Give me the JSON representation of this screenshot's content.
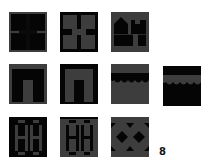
{
  "puzzle": {
    "colors": {
      "dark": "#050505",
      "gray": "#3d3d3d",
      "background": "#ffffff"
    },
    "rows": [
      {
        "tiles": [
          {
            "pattern": "cross-dark-on-gray-lines"
          },
          {
            "pattern": "cross-gray-panels-on-dark"
          },
          {
            "pattern": "house-and-h-silhouette"
          }
        ]
      },
      {
        "tiles": [
          {
            "pattern": "arch-dark-with-gray-frame"
          },
          {
            "pattern": "arch-gray-with-dark-frame"
          },
          {
            "pattern": "wave-gray-top-dark-band"
          },
          {
            "pattern": "wave-dark-top-gray-band"
          }
        ]
      },
      {
        "tiles": [
          {
            "pattern": "double-h-dark"
          },
          {
            "pattern": "double-h-gray"
          },
          {
            "pattern": "diamond-x-lattice"
          }
        ]
      }
    ],
    "answer_label": "8"
  }
}
